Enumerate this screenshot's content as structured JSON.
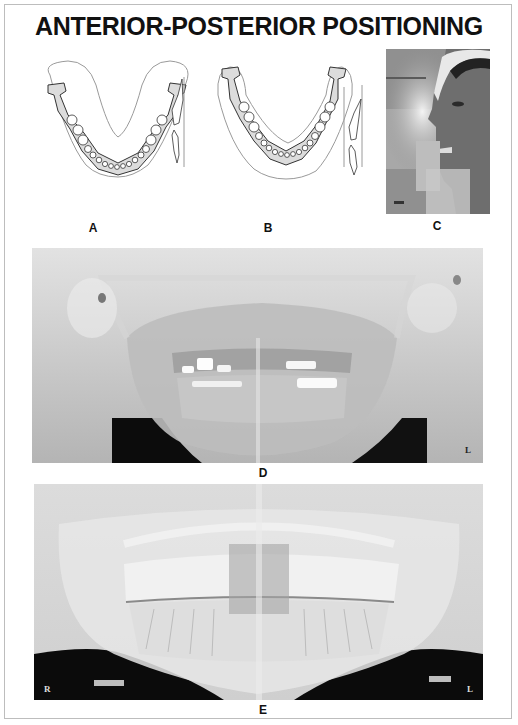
{
  "page": {
    "title": "ANTERIOR-POSTERIOR POSITIONING"
  },
  "panels": [
    {
      "id": "A",
      "label": "A",
      "type": "diagram",
      "description": "Mandible arch positioned too far anterior relative to focal trough"
    },
    {
      "id": "B",
      "label": "B",
      "type": "diagram",
      "description": "Mandible arch positioned too far posterior relative to focal trough"
    },
    {
      "id": "C",
      "label": "C",
      "type": "photo",
      "description": "Patient biting on bite block in panoramic unit"
    },
    {
      "id": "D",
      "label": "D",
      "type": "radiograph",
      "side_marker": "L"
    },
    {
      "id": "E",
      "label": "E",
      "type": "radiograph",
      "side_markers": [
        "R",
        "L"
      ]
    }
  ],
  "colors": {
    "frame_border": "#bdbdbd",
    "text": "#111111",
    "bone_fill": "#dcdcdc",
    "trough_outline": "#9a9a9a",
    "film_dark": "#0c0c0c"
  }
}
